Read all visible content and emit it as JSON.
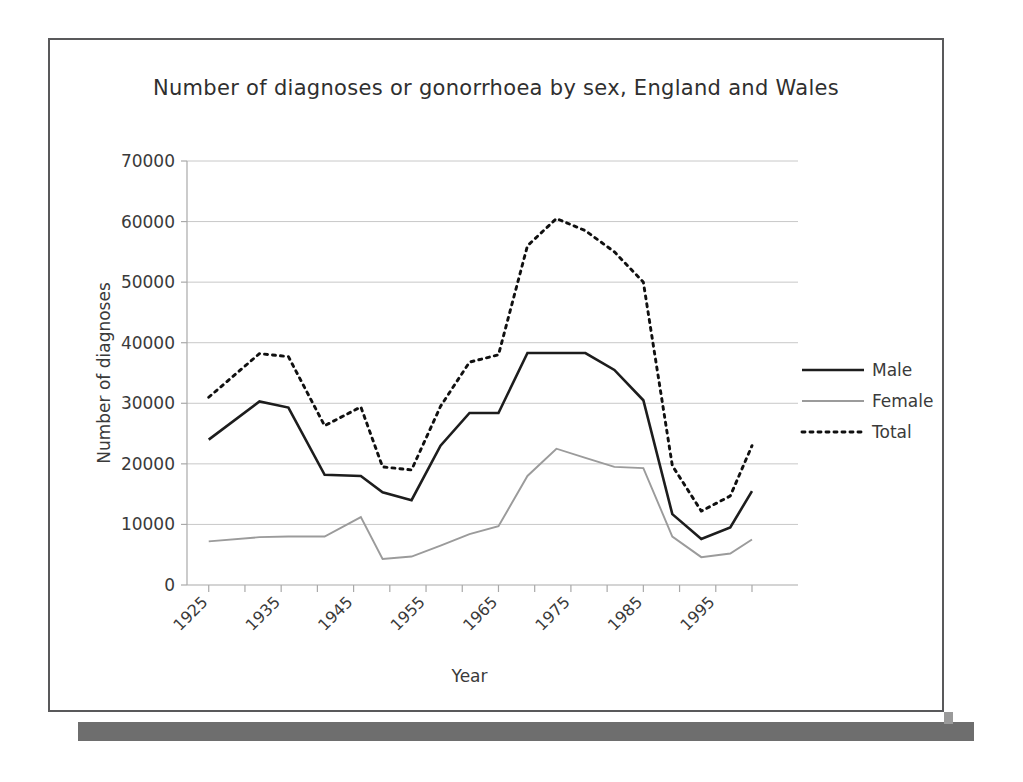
{
  "figure": {
    "title": "Number of diagnoses or gonorrhoea by sex, England and Wales"
  },
  "chart_data": {
    "type": "line",
    "title": "Number of diagnoses or gonorrhoea by sex, England and Wales",
    "xlabel": "Year",
    "ylabel": "Number of diagnoses",
    "xlim": [
      1922,
      2000
    ],
    "ylim": [
      0,
      70000
    ],
    "ytick_labels": [
      "0",
      "10000",
      "20000",
      "30000",
      "40000",
      "50000",
      "60000",
      "70000"
    ],
    "yticks": [
      0,
      10000,
      20000,
      30000,
      40000,
      50000,
      60000,
      70000
    ],
    "xtick_labels": [
      "1925",
      "1935",
      "1945",
      "1955",
      "1965",
      "1975",
      "1985",
      "1995"
    ],
    "xticks": [
      1925,
      1935,
      1945,
      1955,
      1965,
      1975,
      1985,
      1995
    ],
    "xtick_minor_step": 5,
    "grid": "horizontal",
    "legend_position": "right",
    "x": [
      1925,
      1932,
      1936,
      1941,
      1946,
      1949,
      1953,
      1957,
      1961,
      1965,
      1969,
      1973,
      1977,
      1981,
      1985,
      1989,
      1993,
      1997,
      2000
    ],
    "series": [
      {
        "name": "Male",
        "color": "#1d1d1d",
        "style": "solid-thick",
        "values": [
          24000,
          30300,
          29300,
          18200,
          18000,
          15300,
          14000,
          23000,
          28400,
          28400,
          38300,
          38300,
          38300,
          35500,
          30500,
          11700,
          7600,
          9500,
          15500
        ]
      },
      {
        "name": "Female",
        "color": "#9b9b9b",
        "style": "solid-thin",
        "values": [
          7200,
          7900,
          8000,
          8000,
          11200,
          4300,
          4700,
          6500,
          8400,
          9700,
          18000,
          22500,
          21000,
          19500,
          19300,
          8000,
          4600,
          5200,
          7500
        ]
      },
      {
        "name": "Total",
        "color": "#101010",
        "style": "dotted",
        "values": [
          31000,
          38200,
          37700,
          26300,
          29400,
          19500,
          19000,
          29500,
          36800,
          38000,
          56000,
          60500,
          58500,
          55000,
          50000,
          19700,
          12200,
          14700,
          23000
        ]
      }
    ]
  },
  "legend": {
    "entries": [
      {
        "label": "Male"
      },
      {
        "label": "Female"
      },
      {
        "label": "Total"
      }
    ]
  }
}
